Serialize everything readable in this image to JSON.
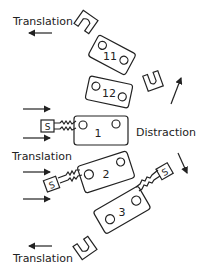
{
  "diagram": {
    "labels": {
      "translation_top": "Translation",
      "translation_middle": "Translation",
      "translation_bottom": "Translation",
      "distraction": "Distraction"
    },
    "blocks": [
      {
        "id": "11",
        "label": "11"
      },
      {
        "id": "12",
        "label": "12"
      },
      {
        "id": "1",
        "label": "1"
      },
      {
        "id": "2",
        "label": "2"
      },
      {
        "id": "3",
        "label": "3"
      }
    ],
    "screw_heads": [
      {
        "id": "s1",
        "label": "S"
      },
      {
        "id": "s2",
        "label": "S"
      },
      {
        "id": "s3",
        "label": "S"
      }
    ],
    "arrows": {
      "translation_top": "left",
      "translation_bottom": "left",
      "push_1": "right",
      "push_2": "right",
      "push_3": "right",
      "push_4": "right",
      "distraction_up": "up-right",
      "distraction_down": "down-right"
    }
  }
}
